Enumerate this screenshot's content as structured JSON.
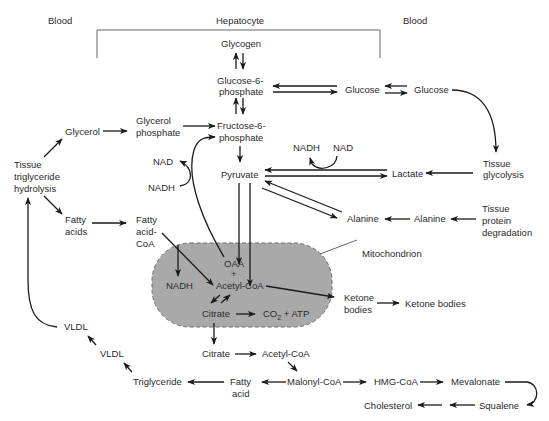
{
  "regions": {
    "blood_left": "Blood",
    "hepatocyte": "Hepatocyte",
    "blood_right": "Blood"
  },
  "nodes": {
    "glycogen": "Glycogen",
    "g6p_1": "Glucose-6-",
    "g6p_2": "phosphate",
    "glucose_liver": "Glucose",
    "glucose_blood": "Glucose",
    "glycerol": "Glycerol",
    "glycerol_phosphate_1": "Glycerol",
    "glycerol_phosphate_2": "phosphate",
    "f6p_1": "Fructose-6-",
    "f6p_2": "phosphate",
    "tg_hydrolysis_1": "Tissue",
    "tg_hydrolysis_2": "triglyceride",
    "tg_hydrolysis_3": "hydrolysis",
    "nad_left": "NAD",
    "nadh_left": "NADH",
    "nadh_top": "NADH",
    "nad_top": "NAD",
    "pyruvate": "Pyruvate",
    "lactate": "Lactate",
    "tissue_glycolysis_1": "Tissue",
    "tissue_glycolysis_2": "glycolysis",
    "fatty_acids_1": "Fatty",
    "fatty_acids_2": "acids",
    "fatty_acid_coa_1": "Fatty",
    "fatty_acid_coa_2": "acid-",
    "fatty_acid_coa_3": "CoA",
    "alanine_liver": "Alanine",
    "alanine_blood": "Alanine",
    "tissue_protein_1": "Tissue",
    "tissue_protein_2": "protein",
    "tissue_protein_3": "degradation",
    "mitochondrion": "Mitochondrion",
    "oaa": "OAA",
    "plus": "+",
    "nadh_mito": "NADH",
    "acetyl_coa_mito": "Acetyl-CoA",
    "citrate_mito": "Citrate",
    "co2_atp_pre": "CO",
    "co2_atp_sub": "2",
    "co2_atp_post": " + ATP",
    "ketone_bodies_liver_1": "Ketone",
    "ketone_bodies_liver_2": "bodies",
    "ketone_bodies_blood": "Ketone bodies",
    "vldl_blood": "VLDL",
    "vldl_liver": "VLDL",
    "citrate_cyto": "Citrate",
    "acetyl_coa_cyto": "Acetyl-CoA",
    "triglyceride": "Triglyceride",
    "fatty_acid_1": "Fatty",
    "fatty_acid_2": "acid",
    "malonyl_coa": "Malonyl-CoA",
    "hmg_coa": "HMG-CoA",
    "mevalonate": "Mevalonate",
    "cholesterol": "Cholesterol",
    "squalene": "Squalene"
  },
  "colors": {
    "mitochondrion_fill": "#a9a9a9",
    "line": "#1a1a1a",
    "text": "#2a2a2a"
  }
}
